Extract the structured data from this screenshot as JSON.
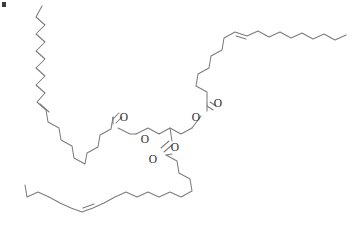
{
  "figure": {
    "background_color": "#ffffff",
    "bond_color": "#7b7b7b",
    "label_color": "#2b2b2b",
    "width": 359,
    "height": 227
  },
  "artifact": {
    "name": "corner-speck",
    "description": "small dark speck at top-left corner"
  },
  "atom_labels": [
    {
      "id": "o-carbonyl-sn1",
      "text": "O",
      "x": 124,
      "y": 118
    },
    {
      "id": "o-ester-sn1",
      "text": "O",
      "x": 145,
      "y": 140
    },
    {
      "id": "o-carbonyl-sn3",
      "text": "O",
      "x": 218,
      "y": 104
    },
    {
      "id": "o-ester-sn3",
      "text": "O",
      "x": 196,
      "y": 118
    },
    {
      "id": "o-carbonyl-sn2",
      "text": "O",
      "x": 153,
      "y": 160
    },
    {
      "id": "o-ester-sn2",
      "text": "O",
      "x": 175,
      "y": 148
    }
  ],
  "chains": [
    {
      "id": "chain-sn1-upper-left",
      "label": "oleoyl chain, upper left",
      "double_bond": "cis",
      "path": "M 42,6 L 36,17 L 45,25 L 36,34 L 45,42 L 36,51 L 45,59 L 36,68 L 45,76 L 36,85 L 45,93 L 37,102 L 46,110 L 48,122 L 59,128 L 61,140 L 72,146 L 74,158 L 85,164 L 87,153 L 98,147 L 100,135 L 111,129 L 113,117"
    },
    {
      "id": "chain-sn3-upper-right",
      "label": "oleoyl chain, upper right",
      "double_bond": "cis",
      "path": "M 207,104 L 207,92 L 196,86 L 198,74 L 209,68 L 211,56 L 222,50 L 224,38 L 235,32 L 247,36 L 258,31 L 269,37 L 280,32 L 291,38 L 302,33 L 313,39 L 324,34 L 335,40 L 346,35"
    },
    {
      "id": "chain-sn2-lower",
      "label": "oleoyl chain, lower",
      "double_bond": "cis",
      "path": "M 166,155 L 177,161 L 179,173 L 190,179 L 192,191 L 181,197 L 170,192 L 159,197 L 148,192 L 137,197 L 126,192 L 115,197 L 104,203 L 93,208 L 82,212 L 71,208 L 60,203 L 49,197 L 38,192 L 27,197 L 25,185"
    }
  ],
  "glycerol": {
    "id": "glycerol-backbone",
    "label": "glycerol backbone",
    "path": "M 136,134 L 148,128 L 159,134 L 170,128 L 181,134 L 192,128"
  },
  "bonds": [
    {
      "id": "ester-bond-sn1",
      "path": "M 113,117 L 113,124 M 118,128 L 130,134 L 136,134"
    },
    {
      "id": "ester-bond-sn3",
      "path": "M 207,104 L 207,111 M 201,116 L 192,128"
    },
    {
      "id": "ester-bond-sn2",
      "path": "M 170,128 L 172,141 M 172,154 L 166,155"
    }
  ],
  "double_bonds": [
    {
      "id": "db-sn1",
      "outer": "M 46,110 L 37,102",
      "inner": "M 49,112 L 40,104"
    },
    {
      "id": "db-sn3",
      "outer": "M 235,32 L 247,36",
      "inner": "M 236,36 L 246,39"
    },
    {
      "id": "db-sn2",
      "outer": "M 93,208 L 82,212",
      "inner": "M 94,204 L 83,208"
    }
  ],
  "carbonyl_double_bonds": [
    {
      "id": "co-sn1",
      "line1": "M 113,119 L 119,113",
      "line2": "M 116,123 L 122,117"
    },
    {
      "id": "co-sn3",
      "line1": "M 207,106 L 213,110",
      "line2": "M 210,102 L 216,106"
    },
    {
      "id": "co-sn2",
      "line1": "M 172,145 L 164,152",
      "line2": "M 169,141 L 161,148"
    }
  ]
}
